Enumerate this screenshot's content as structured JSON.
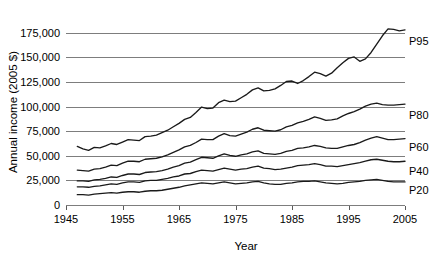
{
  "chart_data": {
    "type": "line",
    "title": "",
    "xlabel": "Year",
    "ylabel": "Annual income (2005 $)",
    "xlim": [
      1945,
      2005
    ],
    "ylim": [
      0,
      187000
    ],
    "grid": true,
    "legend_position": "right-inline",
    "xticks": [
      1945,
      1955,
      1965,
      1975,
      1985,
      1995,
      2005
    ],
    "xtick_labels": [
      "1945",
      "1955",
      "1965",
      "1975",
      "1985",
      "1995",
      "2005"
    ],
    "yticks": [
      0,
      25000,
      50000,
      75000,
      100000,
      125000,
      150000,
      175000
    ],
    "ytick_labels": [
      "0",
      "25,000",
      "50,000",
      "75,000",
      "100,000",
      "125,000",
      "150,000",
      "175,000"
    ],
    "x": [
      1947,
      1948,
      1949,
      1950,
      1951,
      1952,
      1953,
      1954,
      1955,
      1956,
      1957,
      1958,
      1959,
      1960,
      1961,
      1962,
      1963,
      1964,
      1965,
      1966,
      1967,
      1968,
      1969,
      1970,
      1971,
      1972,
      1973,
      1974,
      1975,
      1976,
      1977,
      1978,
      1979,
      1980,
      1981,
      1982,
      1983,
      1984,
      1985,
      1986,
      1987,
      1988,
      1989,
      1990,
      1991,
      1992,
      1993,
      1994,
      1995,
      1996,
      1997,
      1998,
      1999,
      2000,
      2001,
      2002,
      2003,
      2004,
      2005
    ],
    "series": [
      {
        "name": "P95",
        "label": "P95",
        "color": "#1a1a1a",
        "values": [
          59500,
          57000,
          55500,
          58500,
          58000,
          60000,
          62500,
          61500,
          64000,
          66500,
          66000,
          65500,
          69500,
          70000,
          71000,
          73500,
          76000,
          79500,
          83000,
          87000,
          89000,
          94000,
          99500,
          98000,
          98500,
          104000,
          106500,
          105000,
          105500,
          109000,
          112500,
          117000,
          119000,
          116000,
          116500,
          118000,
          121500,
          125500,
          126000,
          123500,
          126500,
          130500,
          135000,
          133500,
          131000,
          134000,
          139500,
          144500,
          149000,
          150500,
          146000,
          148500,
          155000,
          163500,
          172000,
          179000,
          178500,
          177000,
          178000
        ]
      },
      {
        "name": "P80",
        "label": "P80",
        "color": "#1a1a1a",
        "values": [
          35500,
          35000,
          34500,
          36500,
          37000,
          38500,
          40500,
          40000,
          42500,
          44500,
          44500,
          44000,
          46500,
          47000,
          47500,
          49000,
          51000,
          53500,
          56000,
          59000,
          60500,
          63500,
          67000,
          66500,
          66500,
          70000,
          72500,
          70500,
          70000,
          72000,
          74000,
          77000,
          78500,
          76000,
          75500,
          75000,
          76500,
          79500,
          81000,
          83500,
          85000,
          87000,
          89500,
          88000,
          86000,
          86500,
          87500,
          90500,
          93000,
          95000,
          97500,
          100500,
          102500,
          103500,
          102000,
          101500,
          101500,
          102000,
          102500
        ]
      },
      {
        "name": "P60",
        "label": "P60",
        "color": "#1a1a1a",
        "values": [
          24500,
          24500,
          24000,
          25500,
          26000,
          27000,
          28500,
          28000,
          30000,
          31500,
          31500,
          31000,
          33000,
          33500,
          34000,
          35000,
          36500,
          38500,
          40000,
          42500,
          43500,
          46000,
          48500,
          48000,
          47500,
          50000,
          52000,
          50500,
          49500,
          51000,
          52000,
          54000,
          55000,
          52500,
          52000,
          51500,
          52500,
          54500,
          55500,
          57500,
          58000,
          59000,
          60500,
          59500,
          58000,
          57500,
          57500,
          59000,
          60500,
          61500,
          63500,
          66000,
          68000,
          69500,
          68000,
          66500,
          66500,
          67000,
          67500
        ]
      },
      {
        "name": "P40",
        "label": "P40",
        "color": "#1a1a1a",
        "values": [
          18500,
          18500,
          18000,
          19000,
          19500,
          20500,
          21500,
          21000,
          22500,
          23500,
          23500,
          23000,
          24500,
          25000,
          25000,
          26000,
          27000,
          28500,
          29500,
          31500,
          32000,
          34000,
          35500,
          35000,
          34500,
          36000,
          37500,
          36500,
          35500,
          36500,
          37000,
          38500,
          39500,
          37500,
          37000,
          36000,
          36500,
          37500,
          38500,
          40000,
          40500,
          41000,
          42000,
          41000,
          39500,
          39500,
          39000,
          40000,
          41000,
          42000,
          43000,
          44500,
          46000,
          46500,
          45500,
          44500,
          44000,
          44000,
          44500
        ]
      },
      {
        "name": "P20",
        "label": "P20",
        "color": "#1a1a1a",
        "values": [
          10500,
          10500,
          10000,
          11000,
          11500,
          12000,
          12500,
          12000,
          13000,
          13500,
          13500,
          13000,
          14000,
          14500,
          14500,
          15000,
          16000,
          17000,
          18000,
          19500,
          20500,
          21500,
          22500,
          22000,
          21500,
          22500,
          23500,
          22500,
          21500,
          22000,
          22500,
          23500,
          24000,
          22500,
          21500,
          21000,
          21000,
          22000,
          22500,
          23500,
          24000,
          24000,
          24500,
          23500,
          22500,
          22000,
          21500,
          22000,
          23000,
          23500,
          24000,
          25000,
          25500,
          26000,
          25000,
          24000,
          23500,
          23500,
          23500
        ]
      }
    ]
  }
}
